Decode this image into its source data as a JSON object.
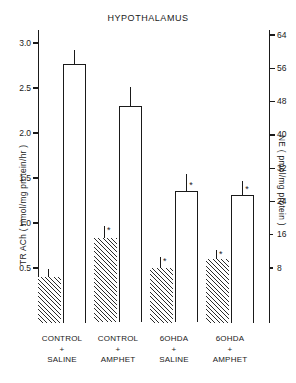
{
  "chart_data": {
    "type": "bar",
    "title": "HYPOTHALAMUS",
    "xlabel": "",
    "categories": [
      "CONTROL\n+\nSALINE",
      "CONTROL\n+\nAMPHET",
      "6OHDA\n+\nSALINE",
      "6OHDA\n+\nAMPHET"
    ],
    "category_lines": [
      [
        "CONTROL",
        "+",
        "SALINE"
      ],
      [
        "CONTROL",
        "+",
        "AMPHET"
      ],
      [
        "6OHDA",
        "+",
        "SALINE"
      ],
      [
        "6OHDA",
        "+",
        "AMPHET"
      ]
    ],
    "grid": false,
    "legend": "none",
    "axes": {
      "left": {
        "label": "TR ACh ( nmol/mg protein/hr )",
        "label_parts": {
          "prefix": "TR",
          "sub": "ACh",
          "units": "( nmol/mg protein/hr )"
        },
        "ticks": [
          0.5,
          1.0,
          1.5,
          2.0,
          2.5,
          3.0
        ],
        "tick_labels": [
          "0.5",
          "1.0",
          "1.5",
          "2.0",
          "2.5",
          "3.0"
        ],
        "lim": [
          0.0,
          3.25
        ]
      },
      "right": {
        "label": "NE ( pmol/mg protein )",
        "ticks": [
          8,
          16,
          24,
          32,
          40,
          48,
          56,
          64
        ],
        "tick_labels": [
          "8",
          "16",
          "24",
          "32",
          "40",
          "48",
          "56",
          "64"
        ],
        "lim": [
          0,
          64
        ]
      }
    },
    "series": [
      {
        "name": "TR ACh",
        "axis": "left",
        "fill": "hatched",
        "units": "nmol/mg protein/hr",
        "values": [
          0.4,
          0.83,
          0.5,
          0.6
        ],
        "errors": [
          0.09,
          0.14,
          0.12,
          0.1
        ],
        "significance": [
          "",
          "*",
          "*",
          "*"
        ]
      },
      {
        "name": "NE",
        "axis": "right",
        "fill": "open",
        "units": "pmol/mg protein",
        "values": [
          57.0,
          47.0,
          26.5,
          25.5
        ],
        "errors": [
          3.5,
          4.5,
          4.0,
          3.5
        ],
        "significance": [
          "",
          "",
          "*",
          "*"
        ]
      }
    ]
  }
}
